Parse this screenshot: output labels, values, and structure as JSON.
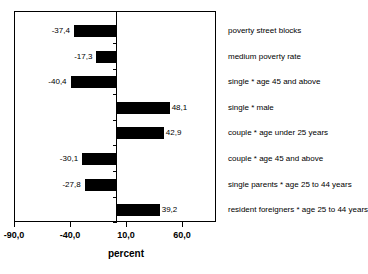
{
  "chart_data": {
    "type": "bar",
    "orientation": "horizontal",
    "title": "",
    "xlabel": "percent",
    "ylabel": "",
    "xlim": [
      -90.0,
      85.0
    ],
    "grid": false,
    "legend": null,
    "decimal_separator": ",",
    "xticks": [
      "-90,0",
      "-40,0",
      "10,0",
      "60,0"
    ],
    "xtick_values": [
      -90.0,
      -40.0,
      10.0,
      60.0
    ],
    "categories": [
      "poverty street blocks",
      "medium  poverty rate",
      "single * age 45 and above",
      "single * male",
      "couple * age under 25 years",
      "couple * age 45 and above",
      "single parents * age 25 to 44 years",
      "resident foreigners * age 25 to 44 years"
    ],
    "values": [
      -37.4,
      -17.3,
      -40.4,
      48.1,
      42.9,
      -30.1,
      -27.8,
      39.2
    ],
    "value_labels": [
      "-37,4",
      "-17,3",
      "-40,4",
      "48,1",
      "42,9",
      "-30,1",
      "-27,8",
      "39,2"
    ],
    "bar_color": "#000000",
    "frame_color": "#000000",
    "background": "#ffffff"
  }
}
